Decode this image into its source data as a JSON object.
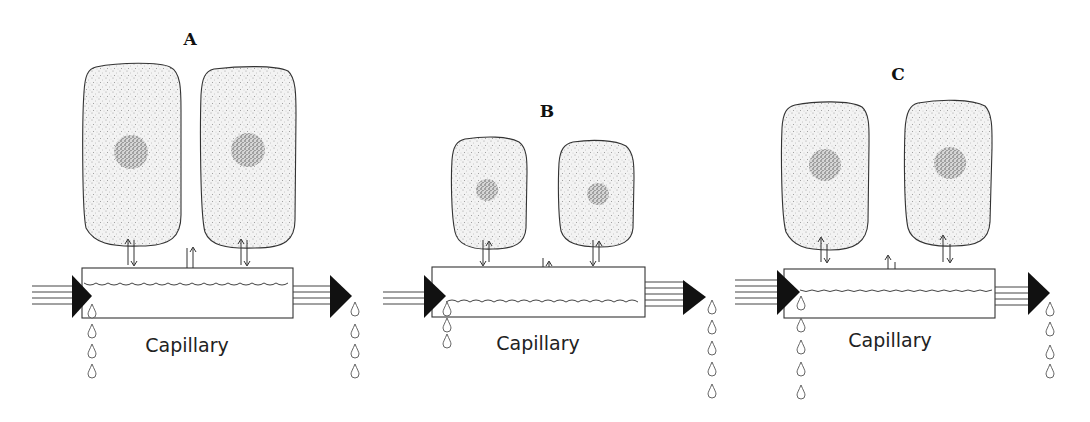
{
  "diagram": {
    "type": "biology-illustration",
    "colors": {
      "ink": "#333333",
      "fill_dark": "#111111",
      "background": "#ffffff"
    },
    "panels": [
      {
        "id": "A",
        "label": "A",
        "capillary_label": "Capillary",
        "cells": [
          {
            "x": 82,
            "y": 66,
            "w": 99,
            "h": 180,
            "nucleus": {
              "cx": 131,
              "cy": 152,
              "r": 17
            }
          },
          {
            "x": 200,
            "y": 68,
            "w": 96,
            "h": 180,
            "nucleus": {
              "cx": 248,
              "cy": 150,
              "r": 17
            }
          }
        ],
        "capillary": {
          "x": 82,
          "y": 268,
          "w": 211,
          "h": 50,
          "wave_y": 283
        },
        "triangles": [
          {
            "x": 72,
            "y": 275,
            "w": 20,
            "h": 43
          },
          {
            "x": 330,
            "y": 275,
            "w": 22,
            "h": 43
          }
        ],
        "exchange_arrows": [
          {
            "x": 131,
            "y1": 238,
            "y2": 265,
            "dir": "up-down"
          },
          {
            "x": 190,
            "y1": 246,
            "y2": 273,
            "dir": "down-up"
          },
          {
            "x": 244,
            "y1": 238,
            "y2": 265,
            "dir": "up-down"
          }
        ],
        "drops_left": {
          "x": 92,
          "y_start": 310,
          "count": 4,
          "gap": 20
        },
        "drops_right": {
          "x": 355,
          "y_start": 310,
          "count": 4,
          "gap": 20
        }
      },
      {
        "id": "B",
        "label": "B",
        "capillary_label": "Capillary",
        "cells": [
          {
            "x": 451,
            "y": 138,
            "w": 76,
            "h": 111,
            "nucleus": {
              "cx": 487,
              "cy": 190,
              "r": 11
            }
          },
          {
            "x": 558,
            "y": 141,
            "w": 76,
            "h": 106,
            "nucleus": {
              "cx": 598,
              "cy": 194,
              "r": 11
            }
          }
        ],
        "capillary": {
          "x": 432,
          "y": 267,
          "w": 213,
          "h": 50,
          "wave_y": 302
        },
        "triangles": [
          {
            "x": 424,
            "y": 275,
            "w": 22,
            "h": 43
          },
          {
            "x": 683,
            "y": 280,
            "w": 23,
            "h": 35
          }
        ],
        "exchange_arrows": [
          {
            "x": 485,
            "y1": 240,
            "y2": 265,
            "dir": "down-up"
          },
          {
            "x": 545,
            "y1": 258,
            "y2": 285,
            "dir": "down-up"
          },
          {
            "x": 595,
            "y1": 240,
            "y2": 265,
            "dir": "down-up"
          }
        ],
        "drops_left": {
          "x": 447,
          "y_start": 306,
          "count": 3,
          "gap": 16
        },
        "drops_right": {
          "x": 712,
          "y_start": 304,
          "count": 5,
          "gap": 20
        }
      },
      {
        "id": "C",
        "label": "C",
        "capillary_label": "Capillary",
        "cells": [
          {
            "x": 781,
            "y": 103,
            "w": 89,
            "h": 147,
            "nucleus": {
              "cx": 825,
              "cy": 165,
              "r": 16
            }
          },
          {
            "x": 904,
            "y": 101,
            "w": 88,
            "h": 145,
            "nucleus": {
              "cx": 950,
              "cy": 163,
              "r": 16
            }
          }
        ],
        "capillary": {
          "x": 784,
          "y": 269,
          "w": 211,
          "h": 49,
          "wave_y": 290
        },
        "triangles": [
          {
            "x": 777,
            "y": 270,
            "w": 23,
            "h": 45
          },
          {
            "x": 1028,
            "y": 272,
            "w": 22,
            "h": 43
          }
        ],
        "exchange_arrows": [
          {
            "x": 823,
            "y1": 238,
            "y2": 262,
            "dir": "up-down"
          },
          {
            "x": 890,
            "y1": 256,
            "y2": 280,
            "dir": "up-down"
          },
          {
            "x": 945,
            "y1": 236,
            "y2": 262,
            "dir": "up-down"
          }
        ],
        "drops_left": {
          "x": 801,
          "y_start": 300,
          "count": 5,
          "gap": 23
        },
        "drops_right": {
          "x": 1050,
          "y_start": 305,
          "count": 4,
          "gap": 22
        }
      }
    ]
  }
}
